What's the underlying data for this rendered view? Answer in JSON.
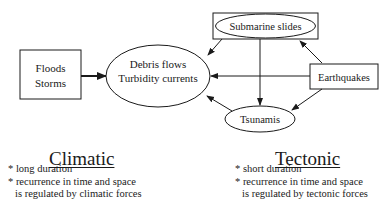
{
  "nodes": {
    "floods_storms": {
      "lines": [
        "Floods",
        "Storms"
      ],
      "shape": "rectangle"
    },
    "debris_turbidity": {
      "lines": [
        "Debris flows",
        "Turbidity currents"
      ],
      "shape": "ellipse"
    },
    "submarine_slides": {
      "label": "Submarine slides",
      "shape": "ellipse-in-rectangle"
    },
    "earthquakes": {
      "label": "Earthquakes",
      "shape": "rectangle"
    },
    "tsunamis": {
      "label": "Tsunamis",
      "shape": "ellipse"
    }
  },
  "edges": [
    {
      "from": "Floods Storms",
      "to": "Debris flows Turbidity currents",
      "style": "bold"
    },
    {
      "from": "Submarine slides",
      "to": "Debris flows Turbidity currents"
    },
    {
      "from": "Submarine slides",
      "to": "Tsunamis"
    },
    {
      "from": "Earthquakes",
      "to": "Submarine slides"
    },
    {
      "from": "Earthquakes",
      "to": "Debris flows Turbidity currents"
    },
    {
      "from": "Earthquakes",
      "to": "Tsunamis"
    },
    {
      "from": "Tsunamis",
      "to": "Debris flows Turbidity currents"
    }
  ],
  "climatic": {
    "title": "Climatic",
    "bullet1": "* long duration",
    "bullet2": "* recurrence in time and space",
    "bullet2_cont": "is regulated by climatic forces"
  },
  "tectonic": {
    "title": "Tectonic",
    "bullet1": "* short duration",
    "bullet2": "* recurrence in time and space",
    "bullet2_cont": "is regulated by tectonic forces"
  }
}
